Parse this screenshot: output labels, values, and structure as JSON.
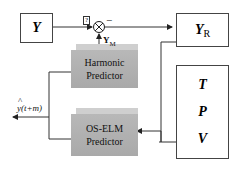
{
  "blocks": {
    "y": {
      "label": "Y"
    },
    "yr": {
      "label": "Y",
      "sub": "R"
    },
    "tpv": {
      "items": [
        "T",
        "P",
        "V"
      ]
    },
    "harmonic": {
      "line1": "Harmonic",
      "line2": "Predictor"
    },
    "oselm": {
      "line1": "OS-ELM",
      "line2": "Predictor"
    }
  },
  "labels": {
    "ym": "Y",
    "ym_sub": "M",
    "minus": "−",
    "plus_box": "?",
    "output_hat": "^",
    "output": "y(t+m)"
  }
}
